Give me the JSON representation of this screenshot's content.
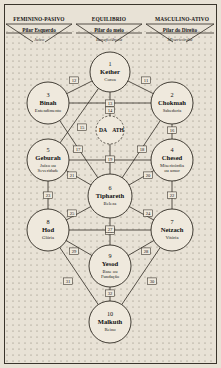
{
  "diagram": {
    "background_color": "#e8e2d6",
    "line_color": "#2f2a22",
    "sphere_fill": "#efe9dd"
  },
  "columns": [
    {
      "header": "FEMININO-PASIVO",
      "pillar": "Pilar Esquerdo",
      "quality": "Juízo"
    },
    {
      "header": "EQUILIBRIO",
      "pillar": "Pilar do meio",
      "quality": "Beneficiência"
    },
    {
      "header": "MASCULINO-ATIVO",
      "pillar": "Pilar do Direito",
      "quality": "Misericórdia"
    }
  ],
  "sephiroth": [
    {
      "num": "1",
      "name": "Kether",
      "sub": "Coroa",
      "cx": 110,
      "cy": 72,
      "r": 20
    },
    {
      "num": "2",
      "name": "Chokmah",
      "sub": "Sabedoria",
      "cx": 172,
      "cy": 103,
      "r": 21
    },
    {
      "num": "3",
      "name": "Binah",
      "sub": "Entendimento",
      "cx": 48,
      "cy": 103,
      "r": 21
    },
    {
      "num": "4",
      "name": "Chesed",
      "sub": "Misericórdia\nou amor",
      "cx": 172,
      "cy": 160,
      "r": 21
    },
    {
      "num": "5",
      "name": "Geburah",
      "sub": "Juízo ou\nSeveridade",
      "cx": 48,
      "cy": 160,
      "r": 21
    },
    {
      "num": "6",
      "name": "Tiphareth",
      "sub": "Beleza",
      "cx": 110,
      "cy": 196,
      "r": 22
    },
    {
      "num": "7",
      "name": "Netzach",
      "sub": "Vitória",
      "cx": 172,
      "cy": 230,
      "r": 21
    },
    {
      "num": "8",
      "name": "Hod",
      "sub": "Glória",
      "cx": 48,
      "cy": 230,
      "r": 21
    },
    {
      "num": "9",
      "name": "Yesod",
      "sub": "Base ou\nFundação",
      "cx": 110,
      "cy": 266,
      "r": 21
    },
    {
      "num": "10",
      "name": "Malkuth",
      "sub": "Reino",
      "cx": 110,
      "cy": 322,
      "r": 21
    }
  ],
  "daath": {
    "label_left": "DA",
    "label_right": "ATH",
    "cx": 110,
    "cy": 130,
    "r": 14
  },
  "paths": [
    {
      "num": "11",
      "from": "1",
      "to": "2",
      "lx": 146,
      "ly": 81
    },
    {
      "num": "12",
      "from": "1",
      "to": "3",
      "lx": 74,
      "ly": 81
    },
    {
      "num": "13",
      "from": "1",
      "to": "6",
      "lx": 110,
      "ly": 104
    },
    {
      "num": "14",
      "from": "3",
      "to": "2",
      "lx": 110,
      "ly": 111
    },
    {
      "num": "15",
      "from": "1",
      "to": "5",
      "lx": 82,
      "ly": 128
    },
    {
      "num": "16",
      "from": "2",
      "to": "4",
      "lx": 172,
      "ly": 131
    },
    {
      "num": "17",
      "from": "3",
      "to": "6",
      "lx": 78,
      "ly": 150
    },
    {
      "num": "18",
      "from": "2",
      "to": "6",
      "lx": 142,
      "ly": 150
    },
    {
      "num": "19",
      "from": "5",
      "to": "4",
      "lx": 110,
      "ly": 160
    },
    {
      "num": "20",
      "from": "4",
      "to": "6",
      "lx": 148,
      "ly": 176
    },
    {
      "num": "21",
      "from": "5",
      "to": "6",
      "lx": 72,
      "ly": 176
    },
    {
      "num": "22",
      "from": "4",
      "to": "7",
      "lx": 172,
      "ly": 196
    },
    {
      "num": "23",
      "from": "5",
      "to": "8",
      "lx": 48,
      "ly": 196
    },
    {
      "num": "24",
      "from": "6",
      "to": "7",
      "lx": 148,
      "ly": 214
    },
    {
      "num": "25",
      "from": "6",
      "to": "8",
      "lx": 72,
      "ly": 214
    },
    {
      "num": "26",
      "from": "6",
      "to": "9",
      "lx": 110,
      "ly": 232
    },
    {
      "num": "27",
      "from": "8",
      "to": "7",
      "lx": 110,
      "ly": 230
    },
    {
      "num": "28",
      "from": "7",
      "to": "9",
      "lx": 146,
      "ly": 252
    },
    {
      "num": "29",
      "from": "8",
      "to": "9",
      "lx": 74,
      "ly": 252
    },
    {
      "num": "30",
      "from": "7",
      "to": "10",
      "lx": 152,
      "ly": 282
    },
    {
      "num": "31",
      "from": "8",
      "to": "10",
      "lx": 68,
      "ly": 282
    },
    {
      "num": "32",
      "from": "9",
      "to": "10",
      "lx": 110,
      "ly": 294
    }
  ]
}
